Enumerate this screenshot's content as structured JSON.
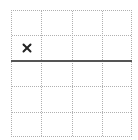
{
  "grid": {
    "columns": 4,
    "rows": 5,
    "line_style": "dotted",
    "line_color": "#b0b0b0"
  },
  "threshold_line": {
    "after_row": 2,
    "color": "#555555"
  },
  "marks": [
    {
      "symbol": "×",
      "icon": "x-mark-icon",
      "row": 2,
      "column": 1,
      "color": "#222222"
    }
  ]
}
